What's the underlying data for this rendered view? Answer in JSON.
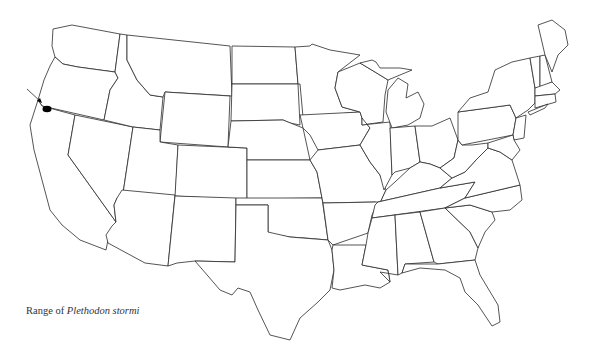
{
  "map": {
    "title": "Range of Plethodon stormi",
    "caption_prefix": "Range of",
    "caption_species": "Plethodon stormi",
    "region": "Contiguous United States (state boundaries)",
    "range_marker": {
      "shape": "filled-ellipse",
      "color": "#000000",
      "location_description": "Oregon–California border near the Pacific coast",
      "cx": 47,
      "cy": 109
    },
    "pointer_arrow": {
      "from": [
        27,
        89
      ],
      "to": [
        42,
        103
      ]
    },
    "colors": {
      "background": "#ffffff",
      "outline": "#2a2a2a",
      "marker": "#000000"
    }
  }
}
